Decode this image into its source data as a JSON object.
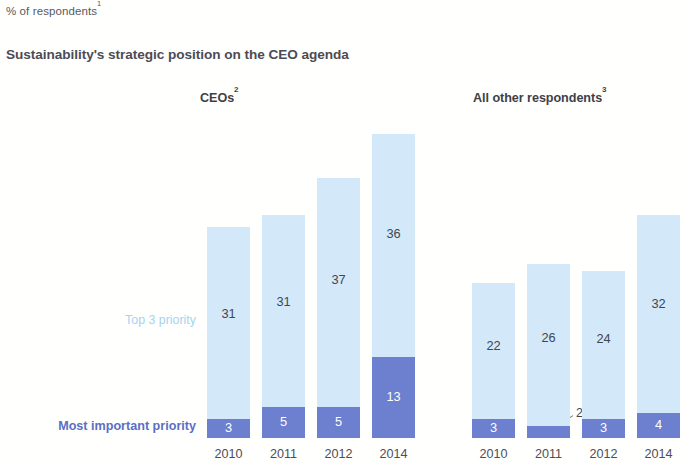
{
  "header": {
    "kicker": "% of respondents",
    "kicker_superscript": "1",
    "headline": "Sustainability's strategic position on the CEO agenda"
  },
  "legend": {
    "top_label": "Top 3 priority",
    "bottom_label": "Most important priority",
    "top_color": "#d3e8f8",
    "bottom_color": "#6c80cf"
  },
  "panels": [
    {
      "title": "CEOs",
      "title_superscript": "2",
      "categories": [
        "2010",
        "2011",
        "2012",
        "2014"
      ],
      "top3": [
        31,
        31,
        37,
        36
      ],
      "most": [
        3,
        5,
        5,
        13
      ]
    },
    {
      "title": "All other respondents",
      "title_superscript": "3",
      "categories": [
        "2010",
        "2011",
        "2012",
        "2014"
      ],
      "top3": [
        22,
        26,
        24,
        32
      ],
      "most": [
        3,
        2,
        3,
        4
      ]
    }
  ],
  "chart_data": {
    "type": "bar",
    "subtype": "stacked-bar",
    "title": "Sustainability's strategic position on the CEO agenda",
    "subtitle": "% of respondents",
    "ylabel": "% of respondents",
    "xlabel": "",
    "grid": false,
    "legend_position": "left-inline",
    "panels": [
      {
        "name": "CEOs",
        "categories": [
          "2010",
          "2011",
          "2012",
          "2014"
        ],
        "series": [
          {
            "name": "Most important priority",
            "values": [
              3,
              5,
              5,
              13
            ],
            "color": "#6c80cf"
          },
          {
            "name": "Top 3 priority",
            "values": [
              31,
              31,
              37,
              36
            ],
            "color": "#d3e8f8"
          }
        ],
        "totals": [
          34,
          36,
          42,
          49
        ]
      },
      {
        "name": "All other respondents",
        "categories": [
          "2010",
          "2011",
          "2012",
          "2014"
        ],
        "series": [
          {
            "name": "Most important priority",
            "values": [
              3,
              2,
              3,
              4
            ],
            "color": "#6c80cf"
          },
          {
            "name": "Top 3 priority",
            "values": [
              22,
              26,
              24,
              32
            ],
            "color": "#d3e8f8"
          }
        ],
        "totals": [
          25,
          28,
          27,
          36
        ]
      }
    ],
    "annotations": [
      {
        "text": "2",
        "panel": "All other respondents",
        "category": "2011",
        "series": "Most important priority",
        "placement": "outside-right"
      }
    ],
    "footnote_markers": [
      "1",
      "2",
      "3"
    ]
  },
  "layout": {
    "scale_px_per_unit": 6.2,
    "baseline_y": 438,
    "panels": [
      {
        "bar_x": [
          207,
          262,
          317,
          372
        ],
        "bar_width": 43
      },
      {
        "bar_x": [
          472,
          527,
          582,
          637
        ],
        "bar_width": 43
      }
    ]
  }
}
